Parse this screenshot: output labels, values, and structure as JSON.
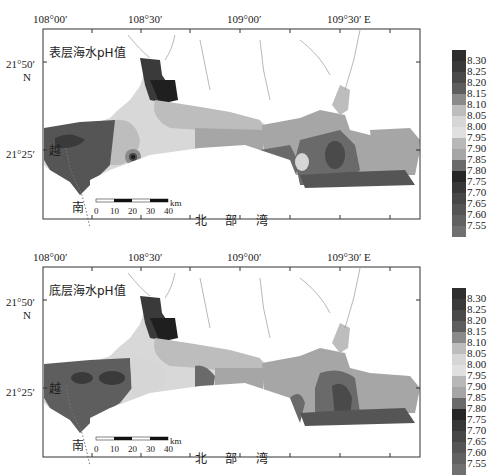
{
  "panels": [
    {
      "title": "表层海水pH值",
      "lon_ticks": [
        "108°00′",
        "108°30′",
        "109°00′",
        "109°30′  E"
      ],
      "lat_ticks": [
        "21°50′",
        "N",
        "21°25′"
      ],
      "country_label": "越",
      "place_labels": [
        "南",
        "北",
        "部",
        "湾"
      ],
      "scale": {
        "ticks": [
          "0",
          "10",
          "20",
          "30",
          "40"
        ],
        "unit": "km"
      }
    },
    {
      "title": "底层海水pH值",
      "lon_ticks": [
        "108°00′",
        "108°30′",
        "109°00′",
        "109°30′  E"
      ],
      "lat_ticks": [
        "21°50′",
        "N",
        "21°25′"
      ],
      "country_label": "越",
      "place_labels": [
        "南",
        "北",
        "部",
        "湾"
      ],
      "scale": {
        "ticks": [
          "0",
          "10",
          "20",
          "30",
          "40"
        ],
        "unit": "km"
      }
    }
  ],
  "legend": {
    "values": [
      "8.30",
      "8.25",
      "8.20",
      "8.15",
      "8.10",
      "8.05",
      "8.00",
      "7.95",
      "7.90",
      "7.85",
      "7.80",
      "7.75",
      "7.70",
      "7.65",
      "7.60",
      "7.55"
    ],
    "colors": [
      "#2e2e2e",
      "#3a3a3a",
      "#4a4a4a",
      "#5e5e5e",
      "#8a8a8a",
      "#bdbdbd",
      "#d6d6d6",
      "#e0e0e0",
      "#b8b8b8",
      "#a6a6a6",
      "#6a6a6a",
      "#262626",
      "#383838",
      "#474747",
      "#555555",
      "#626262",
      "#707070"
    ]
  }
}
